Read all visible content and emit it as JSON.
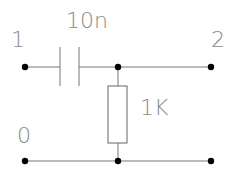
{
  "diagram": {
    "type": "circuit-schematic",
    "nodes": [
      {
        "id": "node-1",
        "label": "1"
      },
      {
        "id": "node-2",
        "label": "2"
      },
      {
        "id": "node-0",
        "label": "0"
      }
    ],
    "components": [
      {
        "type": "capacitor",
        "value": "10n",
        "between": [
          "1",
          "2"
        ]
      },
      {
        "type": "resistor",
        "value": "1K",
        "between": [
          "2",
          "0"
        ]
      }
    ],
    "colors": {
      "wire": "#777777",
      "node": "#000000",
      "label": "#8a8a8a"
    }
  }
}
